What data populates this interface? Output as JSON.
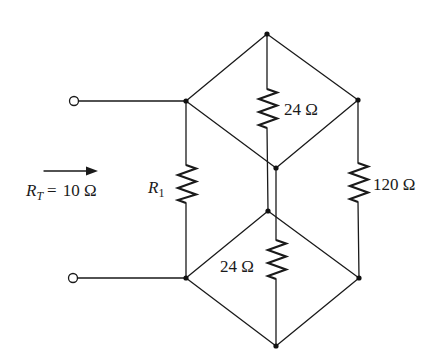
{
  "diagram": {
    "type": "circuit",
    "total_resistance": {
      "symbol": "R",
      "subscript": "T",
      "equals": "=",
      "value": "10 Ω"
    },
    "resistors": [
      {
        "id": "R1",
        "symbol": "R",
        "subscript": "1",
        "label": ""
      },
      {
        "id": "upper-center",
        "label": "24 Ω"
      },
      {
        "id": "right",
        "label": "120 Ω"
      },
      {
        "id": "lower-center",
        "label": "24 Ω"
      }
    ],
    "terminals": [
      "top-terminal",
      "bottom-terminal"
    ],
    "arrow": "input-direction-arrow"
  }
}
